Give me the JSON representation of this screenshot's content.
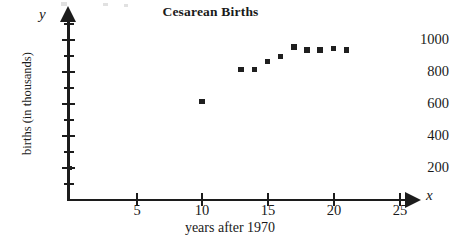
{
  "chart_data": {
    "type": "scatter",
    "title": "Cesarean Births",
    "xlabel": "years after 1970",
    "ylabel": "births (in thousands)",
    "axis_letter_x": "x",
    "axis_letter_y": "y",
    "xlim": [
      0,
      26.5
    ],
    "ylim": [
      0,
      1100
    ],
    "grid": false,
    "legend": null,
    "x_ticks": [
      5,
      10,
      15,
      20,
      25
    ],
    "x_tick_labels": [
      "5",
      "10",
      "15",
      "20",
      "25"
    ],
    "y_ticks": [
      200,
      400,
      600,
      800,
      1000
    ],
    "y_tick_labels": [
      "200",
      "400",
      "600",
      "800",
      "1000"
    ],
    "y_minor_ticks": [
      100,
      300,
      500,
      700,
      900,
      1100
    ],
    "x": [
      10,
      13,
      14,
      15,
      16,
      17,
      18,
      19,
      20,
      21
    ],
    "y": [
      610,
      810,
      810,
      860,
      890,
      950,
      930,
      930,
      940,
      930
    ],
    "points": [
      {
        "x": 10,
        "y": 610
      },
      {
        "x": 13,
        "y": 810
      },
      {
        "x": 14,
        "y": 810
      },
      {
        "x": 15,
        "y": 860
      },
      {
        "x": 16,
        "y": 890
      },
      {
        "x": 17,
        "y": 950
      },
      {
        "x": 18,
        "y": 930
      },
      {
        "x": 19,
        "y": 930
      },
      {
        "x": 20,
        "y": 940
      },
      {
        "x": 21,
        "y": 930
      }
    ],
    "marker_color": "#1f1f1f",
    "marker_shape": "square",
    "axis_color": "#1c1c1c"
  }
}
